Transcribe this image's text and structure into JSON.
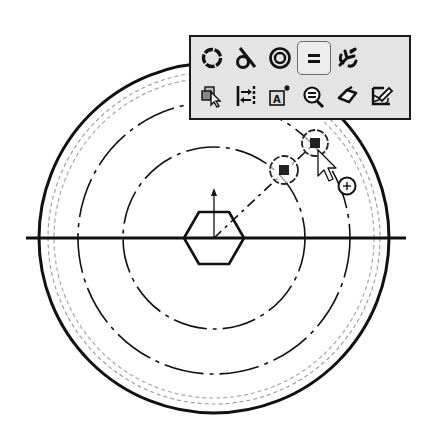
{
  "window": {
    "type": "CAD sketch editor - context toolbar (Add Relations)"
  },
  "context_toolbar": {
    "row1": [
      {
        "name": "coradial-relation",
        "icon": "dashed-circle-icon",
        "label": "Coradial"
      },
      {
        "name": "tangent-relation",
        "icon": "tangent-icon",
        "label": "Tangent"
      },
      {
        "name": "concentric-relation",
        "icon": "concentric-circles-icon",
        "label": "Concentric"
      },
      {
        "name": "equal-relation",
        "icon": "equal-icon",
        "label": "Equal",
        "active": true
      },
      {
        "name": "fix-relation",
        "icon": "anchor-fix-icon",
        "label": "Fix"
      }
    ],
    "row2": [
      {
        "name": "select-other",
        "icon": "select-other-icon",
        "label": "Select Other"
      },
      {
        "name": "convert-construction",
        "icon": "construction-geometry-icon",
        "label": "Construction Geometry"
      },
      {
        "name": "smart-dimension",
        "icon": "annotation-text-icon",
        "label": "Smart Dimension"
      },
      {
        "name": "zoom-to-selection",
        "icon": "zoom-equal-icon",
        "label": "Zoom to Selection"
      },
      {
        "name": "sketch-tag",
        "icon": "tag-icon",
        "label": "Tag"
      },
      {
        "name": "edit-sketch",
        "icon": "edit-sketch-icon",
        "label": "Edit Sketch"
      }
    ]
  },
  "sketch": {
    "center": [
      214,
      238
    ],
    "outer_circle_radius": 175,
    "hidden_circle_radii": [
      160,
      166
    ],
    "construction_circle_radii": [
      136,
      91
    ],
    "hexagon_radius": 30,
    "centerline": {
      "x1": 26,
      "x2": 406,
      "y": 238
    },
    "colors": {
      "line": "#111111",
      "hidden": "#9a9a9a",
      "toolbar_bg": "#e4e4e4",
      "toolbar_border": "#1a1a1a"
    }
  },
  "selection_markers": [
    {
      "name": "selected-point-1",
      "cx": 284,
      "cy": 170,
      "r": 14
    },
    {
      "name": "selected-point-2",
      "cx": 315,
      "cy": 143,
      "r": 13
    }
  ],
  "cursor": {
    "x": 318,
    "y": 158,
    "badge": "+"
  }
}
